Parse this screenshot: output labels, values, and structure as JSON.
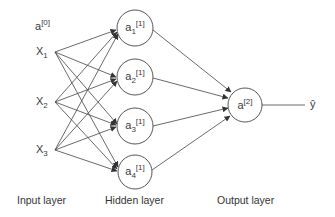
{
  "diagram": {
    "type": "neural-network",
    "colors": {
      "line": "#444444",
      "text": "#3a3a3a",
      "background": "#ffffff"
    },
    "input_layer": {
      "label": "Input layer",
      "bias": {
        "base": "a",
        "sup": "[0]"
      },
      "nodes": [
        {
          "id": "x1",
          "base": "X",
          "sub": "1"
        },
        {
          "id": "x2",
          "base": "X",
          "sub": "2"
        },
        {
          "id": "x3",
          "base": "X",
          "sub": "3"
        }
      ]
    },
    "hidden_layer": {
      "label": "Hidden layer",
      "nodes": [
        {
          "id": "a1",
          "base": "a",
          "sub": "1",
          "sup": "[1]"
        },
        {
          "id": "a2",
          "base": "a",
          "sub": "2",
          "sup": "[1]"
        },
        {
          "id": "a3",
          "base": "a",
          "sub": "3",
          "sup": "[1]"
        },
        {
          "id": "a4",
          "base": "a",
          "sub": "4",
          "sup": "[1]"
        }
      ]
    },
    "output_layer": {
      "label": "Output layer",
      "node": {
        "id": "a2out",
        "base": "a",
        "sup": "[2]"
      },
      "output": "ŷ"
    },
    "edges": [
      [
        "x1",
        "a1"
      ],
      [
        "x1",
        "a2"
      ],
      [
        "x1",
        "a3"
      ],
      [
        "x1",
        "a4"
      ],
      [
        "x2",
        "a1"
      ],
      [
        "x2",
        "a2"
      ],
      [
        "x2",
        "a3"
      ],
      [
        "x2",
        "a4"
      ],
      [
        "x3",
        "a1"
      ],
      [
        "x3",
        "a2"
      ],
      [
        "x3",
        "a3"
      ],
      [
        "x3",
        "a4"
      ],
      [
        "a1",
        "a2out"
      ],
      [
        "a2",
        "a2out"
      ],
      [
        "a3",
        "a2out"
      ],
      [
        "a4",
        "a2out"
      ],
      [
        "a2out",
        "y_hat"
      ]
    ]
  }
}
